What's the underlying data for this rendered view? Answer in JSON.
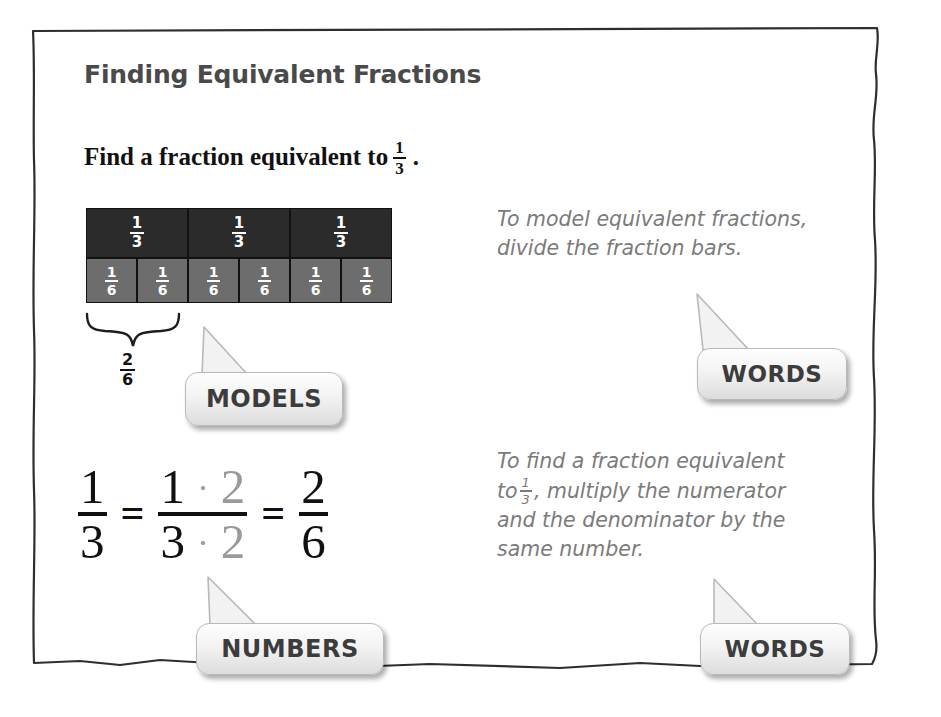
{
  "page": {
    "title": "Finding Equivalent Fractions",
    "prompt": {
      "text_before": "Find a fraction equivalent to",
      "fraction": {
        "numerator": "1",
        "denominator": "3"
      },
      "text_after": "."
    }
  },
  "model": {
    "thirds_row": [
      {
        "numerator": "1",
        "denominator": "3"
      },
      {
        "numerator": "1",
        "denominator": "3"
      },
      {
        "numerator": "1",
        "denominator": "3"
      }
    ],
    "sixths_row": [
      {
        "numerator": "1",
        "denominator": "6"
      },
      {
        "numerator": "1",
        "denominator": "6"
      },
      {
        "numerator": "1",
        "denominator": "6"
      },
      {
        "numerator": "1",
        "denominator": "6"
      },
      {
        "numerator": "1",
        "denominator": "6"
      },
      {
        "numerator": "1",
        "denominator": "6"
      }
    ],
    "brace_label": {
      "numerator": "2",
      "denominator": "6"
    },
    "colors": {
      "thirds_fill": "#2b2b2b",
      "sixths_fill": "#6d6d6d",
      "label_text": "#ffffff"
    }
  },
  "equation": {
    "left": {
      "numerator": "1",
      "denominator": "3"
    },
    "equals_1": "=",
    "middle": {
      "numerator_base": "1",
      "numerator_dot": "·",
      "numerator_multiplier": "2",
      "denominator_base": "3",
      "denominator_dot": "·",
      "denominator_multiplier": "2"
    },
    "equals_2": "=",
    "right": {
      "numerator": "2",
      "denominator": "6"
    },
    "multiplier_color": "#9a9a9a"
  },
  "notes": {
    "words_top": {
      "lines": [
        {
          "text": "To model equivalent fractions,"
        },
        {
          "text": "divide the fraction bars."
        }
      ]
    },
    "words_bottom": {
      "line1": "To find a fraction equivalent",
      "line2_before": "to",
      "line2_fraction": {
        "numerator": "1",
        "denominator": "3"
      },
      "line2_after": ", multiply the numerator",
      "line3": "and the denominator by the",
      "line4": "same number."
    },
    "text_color": "#7b7b7b"
  },
  "callouts": {
    "models": "MODELS",
    "words_right_top": "WORDS",
    "numbers": "NUMBERS",
    "words_bottom_right": "WORDS"
  }
}
